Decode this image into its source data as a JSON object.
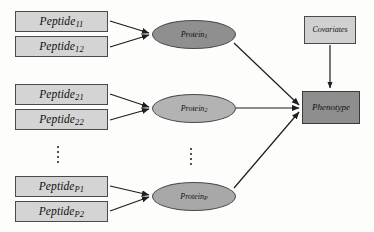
{
  "diagram": {
    "colors": {
      "peptide_box_fill": "#d4d4d4",
      "protein_ellipse_dark": "#8f8f8f",
      "protein_ellipse_mid": "#b3b3b3",
      "protein_ellipse_light": "#a8a8a8",
      "covariates_fill": "#d0d0d0",
      "phenotype_fill": "#8e8e8e",
      "stroke": "#3a3a3a",
      "background": "#fdfdfc"
    },
    "peptides": [
      {
        "base": "Peptide",
        "sub": "11",
        "x": 15,
        "y": 11,
        "w": 93,
        "h": 21
      },
      {
        "base": "Peptide",
        "sub": "12",
        "x": 15,
        "y": 36,
        "w": 93,
        "h": 21
      },
      {
        "base": "Peptide",
        "sub": "21",
        "x": 15,
        "y": 84,
        "w": 93,
        "h": 21
      },
      {
        "base": "Peptide",
        "sub": "22",
        "x": 15,
        "y": 109,
        "w": 93,
        "h": 21
      },
      {
        "base": "Peptide",
        "sub": "P1",
        "x": 15,
        "y": 176,
        "w": 93,
        "h": 21
      },
      {
        "base": "Peptide",
        "sub": "P2",
        "x": 15,
        "y": 201,
        "w": 93,
        "h": 21
      }
    ],
    "proteins": [
      {
        "base": "Protein",
        "sub": "1",
        "x": 152,
        "y": 20,
        "w": 84,
        "h": 29,
        "shade": "dark"
      },
      {
        "base": "Protein",
        "sub": "2",
        "x": 152,
        "y": 94,
        "w": 84,
        "h": 29,
        "shade": "mid"
      },
      {
        "base": "Protein",
        "sub": "P",
        "x": 152,
        "y": 182,
        "w": 84,
        "h": 29,
        "shade": "light"
      }
    ],
    "covariates": {
      "label": "Covariates",
      "x": 304,
      "y": 16,
      "w": 52,
      "h": 28
    },
    "phenotype": {
      "label": "Phenotype",
      "x": 302,
      "y": 91,
      "w": 58,
      "h": 33
    },
    "ellipsis": [
      {
        "name": "peptide-column-ellipsis",
        "x": 57,
        "y": 146,
        "dots": 4
      },
      {
        "name": "protein-column-ellipsis",
        "x": 190,
        "y": 148,
        "dots": 4
      }
    ],
    "edges": [
      {
        "from": "peptide-11",
        "to": "protein-1",
        "d": "M 110,21 L 149,33"
      },
      {
        "from": "peptide-12",
        "to": "protein-1",
        "d": "M 110,47 L 149,35"
      },
      {
        "from": "peptide-21",
        "to": "protein-2",
        "d": "M 110,94 L 149,107"
      },
      {
        "from": "peptide-22",
        "to": "protein-2",
        "d": "M 110,120 L 149,109"
      },
      {
        "from": "peptide-P1",
        "to": "protein-P",
        "d": "M 110,186 L 149,195"
      },
      {
        "from": "peptide-P2",
        "to": "protein-P",
        "d": "M 110,211 L 149,197"
      },
      {
        "from": "protein-1",
        "to": "phenotype",
        "d": "M 234,43 L 299,105"
      },
      {
        "from": "protein-2",
        "to": "phenotype",
        "d": "M 236,108 L 299,108"
      },
      {
        "from": "protein-P",
        "to": "phenotype",
        "d": "M 234,188 L 299,112"
      },
      {
        "from": "covariates",
        "to": "phenotype",
        "d": "M 330,45 L 330,88"
      }
    ]
  }
}
